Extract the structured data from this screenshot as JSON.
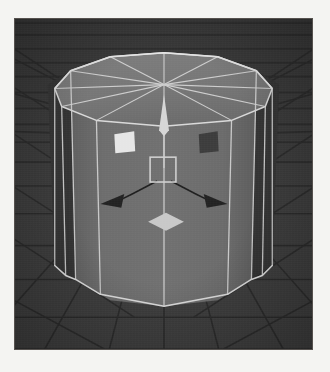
{
  "app": {
    "title": "3D Viewport",
    "viewport_label": "perspective-viewport",
    "background_color": "#3a3a3a",
    "page_background_color": "#f4f4f2"
  },
  "scene": {
    "grid": {
      "name": "floor-grid",
      "line_color": "#2a2a2a",
      "visible": true,
      "perspective": "vanishing-toward-center"
    },
    "object": {
      "name": "cylinder",
      "shape": "cylinder",
      "sides": 12,
      "selected": true,
      "wireframe_visible": true,
      "wireframe_color": "#d8d8d8",
      "face_color_front": "#6e6e6e",
      "face_color_side_dark": "#333333",
      "face_color_top": "#7a7a7a",
      "top_cap": {
        "name": "top-cap",
        "triangulation": "radial-fan",
        "fan_segments": 12
      }
    }
  },
  "gizmo": {
    "name": "transform-gizmo",
    "type": "move",
    "center_handle": {
      "name": "center-square-handle",
      "shape": "square-outline",
      "stroke_color": "#cfcfcf",
      "fill": "none"
    },
    "axes": [
      {
        "name": "axis-z-arrow",
        "label": "Z",
        "direction": "up",
        "color": "#d6d6d6",
        "style": "filled-cone"
      },
      {
        "name": "axis-x-arrow",
        "label": "X",
        "direction": "left-down",
        "color": "#222222",
        "style": "filled-arrowhead"
      },
      {
        "name": "axis-y-arrow",
        "label": "Y",
        "direction": "right-down",
        "color": "#222222",
        "style": "filled-arrowhead"
      }
    ],
    "plane_handle": {
      "name": "plane-diamond-handle",
      "shape": "diamond",
      "fill_color": "#c8c8c8"
    },
    "extra_handles": [
      {
        "name": "left-square-handle",
        "shape": "square",
        "fill_color": "#e6e6e6",
        "state": "highlighted"
      },
      {
        "name": "right-square-handle",
        "shape": "square",
        "fill_color": "#3c3c3c",
        "state": "normal"
      }
    ]
  }
}
